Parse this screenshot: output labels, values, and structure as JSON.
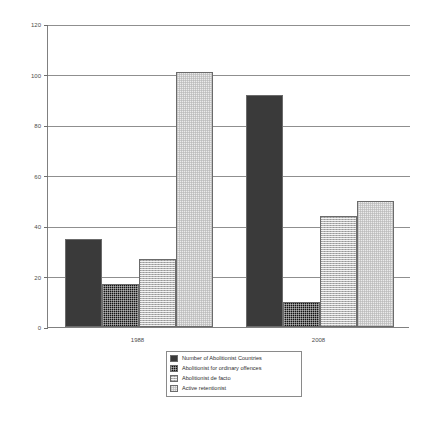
{
  "chart_data": {
    "type": "bar",
    "title": "",
    "subtitle": "",
    "xlabel": "",
    "ylabel": "",
    "categories": [
      "1988",
      "2008"
    ],
    "ylim": [
      0,
      120
    ],
    "yticks": [
      0,
      20,
      40,
      60,
      80,
      100,
      120
    ],
    "ytick_labels": [
      "0",
      "20",
      "40",
      "60",
      "80",
      "100",
      "120"
    ],
    "grid": true,
    "legend_position": "bottom-center",
    "series": [
      {
        "name": "Number of Abolitionist Countries",
        "values": [
          35,
          92
        ],
        "color": "#3a3a3a",
        "pattern": "solid-dark"
      },
      {
        "name": "Abolitionist for ordinary offences",
        "values": [
          17,
          10
        ],
        "color": "#121212",
        "pattern": "dark-dotted"
      },
      {
        "name": "Abolitionist de facto",
        "values": [
          27,
          44
        ],
        "color": "#b3b3b3",
        "pattern": "gray-checker"
      },
      {
        "name": "Active retentionist",
        "values": [
          101,
          50
        ],
        "color": "#ebebeb",
        "pattern": "light-checker"
      }
    ]
  },
  "legend": {
    "items": [
      {
        "label": "Number of Abolitionist Countries"
      },
      {
        "label": "Abolitionist for ordinary offences"
      },
      {
        "label": "Abolitionist de facto"
      },
      {
        "label": "Active retentionist"
      }
    ]
  }
}
